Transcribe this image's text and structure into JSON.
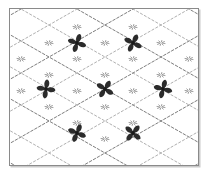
{
  "figure": {
    "frame": {
      "border_color": "#8a8a8a",
      "shadow_color": "#c9c9c9",
      "background_color": "#ffffff",
      "x": 9,
      "y": 8,
      "width": 190,
      "height": 158
    },
    "lattice": {
      "style": "dashed",
      "line_color": "#6e6e6e",
      "soft_line_color": "#9a9a9a",
      "dash_pattern": "2.6 1.9",
      "cell_half_width": 28,
      "cell_half_height": 16,
      "origin_x": 105,
      "origin_y": 89,
      "columns": 7,
      "rows": 7
    },
    "motifs": {
      "shape": "four-petal-pinwheel-flower",
      "petal_count": 4,
      "petal_color": "#2b2b2b",
      "center_color": "#1a1a1a",
      "count": 7,
      "rows": [
        {
          "name": "top-row",
          "y": 43,
          "items": [
            {
              "name": "motif-top-left",
              "x": 77,
              "y": 43,
              "rotation": 18,
              "size": 8.5
            },
            {
              "name": "motif-top-right",
              "x": 133,
              "y": 43,
              "rotation": 26,
              "size": 8.5
            }
          ]
        },
        {
          "name": "middle-row",
          "y": 89,
          "items": [
            {
              "name": "motif-middle-left",
              "x": 46,
              "y": 89,
              "rotation": 8,
              "size": 8.5
            },
            {
              "name": "motif-middle-center",
              "x": 105,
              "y": 89,
              "rotation": 32,
              "size": 8.5
            },
            {
              "name": "motif-middle-right",
              "x": 163,
              "y": 89,
              "rotation": 14,
              "size": 8.5
            }
          ]
        },
        {
          "name": "bottom-row",
          "y": 133,
          "items": [
            {
              "name": "motif-bottom-left",
              "x": 77,
              "y": 133,
              "rotation": 22,
              "size": 8.5
            },
            {
              "name": "motif-bottom-right",
              "x": 133,
              "y": 133,
              "rotation": 40,
              "size": 8.5
            }
          ]
        }
      ]
    },
    "nodes": [
      {
        "x": 77,
        "y": 27
      },
      {
        "x": 133,
        "y": 27
      },
      {
        "x": 49,
        "y": 43
      },
      {
        "x": 105,
        "y": 43
      },
      {
        "x": 161,
        "y": 43
      },
      {
        "x": 21,
        "y": 59
      },
      {
        "x": 77,
        "y": 59
      },
      {
        "x": 133,
        "y": 59
      },
      {
        "x": 189,
        "y": 59
      },
      {
        "x": 49,
        "y": 75
      },
      {
        "x": 105,
        "y": 75
      },
      {
        "x": 161,
        "y": 75
      },
      {
        "x": 21,
        "y": 91
      },
      {
        "x": 77,
        "y": 91
      },
      {
        "x": 133,
        "y": 91
      },
      {
        "x": 189,
        "y": 91
      },
      {
        "x": 49,
        "y": 107
      },
      {
        "x": 105,
        "y": 107
      },
      {
        "x": 161,
        "y": 107
      },
      {
        "x": 77,
        "y": 123
      },
      {
        "x": 133,
        "y": 123
      },
      {
        "x": 105,
        "y": 139
      }
    ]
  }
}
